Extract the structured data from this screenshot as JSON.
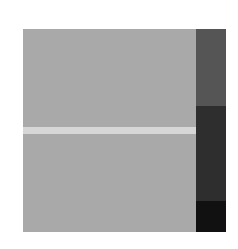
{
  "graphic": {
    "panel_color": "#a9a9a9",
    "stripe_color": "#d6d6d6",
    "column_segments": [
      {
        "name": "top",
        "color": "#555555"
      },
      {
        "name": "middle",
        "color": "#2e2e2e"
      },
      {
        "name": "bottom",
        "color": "#111111"
      }
    ]
  }
}
